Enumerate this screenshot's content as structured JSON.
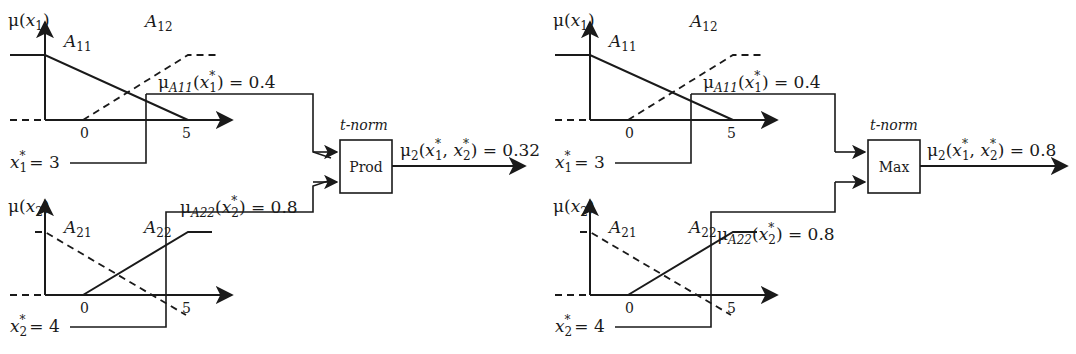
{
  "diagrams": [
    {
      "name": "prod",
      "top_plot": {
        "y_label_pre": "μ(",
        "y_label_var": "x",
        "y_label_sub": "1",
        "y_label_post": ")",
        "set_a": "A",
        "set_a_sub": "11",
        "set_b": "A",
        "set_b_sub": "12",
        "tick_0": "0",
        "tick_5": "5",
        "input_var": "x",
        "input_sub": "1",
        "input_value": "= 3",
        "mu_label": "μ",
        "mu_sub": "A11",
        "mu_arg_var": "x",
        "mu_arg_sub": "1",
        "mu_value": ") = 0.4"
      },
      "bottom_plot": {
        "y_label_pre": "μ(",
        "y_label_var": "x",
        "y_label_sub": "2",
        "y_label_post": ")",
        "set_a": "A",
        "set_a_sub": "21",
        "set_b": "A",
        "set_b_sub": "22",
        "tick_0": "0",
        "tick_5": "5",
        "input_var": "x",
        "input_sub": "2",
        "input_value": "= 4",
        "mu_label": "μ",
        "mu_sub": "A22",
        "mu_arg_var": "x",
        "mu_arg_sub": "2",
        "mu_value": ") = 0.8"
      },
      "operator": {
        "caption": "t-norm",
        "label": "Prod"
      },
      "output": {
        "mu": "μ",
        "mu_sub": "2",
        "args": "(x*₁, x*₂)",
        "value": "= 0.32"
      }
    },
    {
      "name": "max",
      "top_plot": {
        "y_label_pre": "μ(",
        "y_label_var": "x",
        "y_label_sub": "1",
        "y_label_post": ")",
        "set_a": "A",
        "set_a_sub": "11",
        "set_b": "A",
        "set_b_sub": "12",
        "tick_0": "0",
        "tick_5": "5",
        "input_var": "x",
        "input_sub": "1",
        "input_value": "= 3",
        "mu_label": "μ",
        "mu_sub": "A11",
        "mu_arg_var": "x",
        "mu_arg_sub": "1",
        "mu_value": ") = 0.4"
      },
      "bottom_plot": {
        "y_label_pre": "μ(",
        "y_label_var": "x",
        "y_label_sub": "2",
        "y_label_post": ")",
        "set_a": "A",
        "set_a_sub": "21",
        "set_b": "A",
        "set_b_sub": "22",
        "tick_0": "0",
        "tick_5": "5",
        "input_var": "x",
        "input_sub": "2",
        "input_value": "= 4",
        "mu_label": "μ",
        "mu_sub": "A22",
        "mu_arg_var": "x",
        "mu_arg_sub": "2",
        "mu_value": ") = 0.8"
      },
      "operator": {
        "caption": "t-norm",
        "label": "Max"
      },
      "output": {
        "mu": "μ",
        "mu_sub": "2",
        "args": "(x*₁, x*₂)",
        "value": "= 0.8"
      }
    }
  ],
  "colors": {
    "stroke": "#1a1a1a",
    "background": "#ffffff"
  }
}
